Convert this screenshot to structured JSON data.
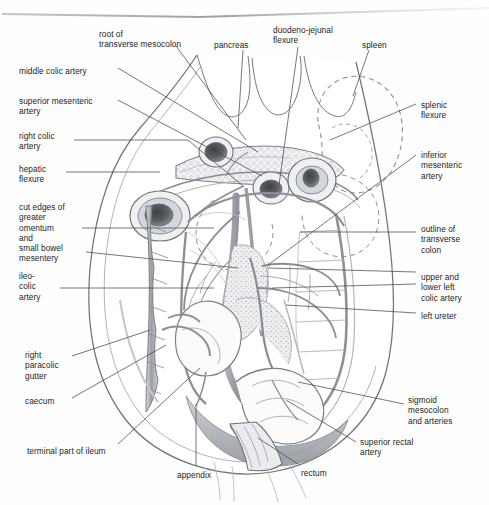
{
  "figure": {
    "medium": "pencil-and-wash anatomical drawing (scanned textbook page)",
    "colors": {
      "paper": "#fefefe",
      "ink": "#1c1c1c",
      "leader": "#4a4a4a",
      "outline": "#6f7378",
      "vessel": "#8d9097",
      "wash_light": "#e7e9ec",
      "wash_mid": "#c9ccd1",
      "wash_dark": "#9aa0a7",
      "cut_lumen": "#55585d",
      "dashed": "#8b9096"
    }
  },
  "labels": {
    "top": [
      {
        "id": "root-of-transverse-mesocolon",
        "lines": [
          "root of",
          "transverse mesocolon"
        ],
        "x": 99,
        "y": 29
      },
      {
        "id": "pancreas",
        "lines": [
          "pancreas"
        ],
        "x": 214,
        "y": 40
      },
      {
        "id": "duodeno-jejunal-flexure",
        "lines": [
          "duodeno-jejunal",
          "flexure"
        ],
        "x": 273,
        "y": 25
      },
      {
        "id": "spleen",
        "lines": [
          "spleen"
        ],
        "x": 362,
        "y": 40
      }
    ],
    "left": [
      {
        "id": "middle-colic-artery",
        "lines": [
          "middle colic artery"
        ],
        "x": 19,
        "y": 66
      },
      {
        "id": "superior-mesenteric-artery",
        "lines": [
          "superior mesenteric",
          "artery"
        ],
        "x": 19,
        "y": 96
      },
      {
        "id": "right-colic-artery",
        "lines": [
          "right colic",
          "artery"
        ],
        "x": 19,
        "y": 131
      },
      {
        "id": "hepatic-flexure",
        "lines": [
          "hepatic",
          "flexure"
        ],
        "x": 19,
        "y": 164
      },
      {
        "id": "cut-edges-of-greater-omentum-and-small-bowel-mesentery",
        "lines": [
          "cut edges of",
          "greater",
          "omentum",
          "and",
          "small bowel",
          "mesentery"
        ],
        "x": 19,
        "y": 202
      },
      {
        "id": "ileo-colic-artery",
        "lines": [
          "ileo-",
          "colic",
          "artery"
        ],
        "x": 19,
        "y": 271
      },
      {
        "id": "right-paracolic-gutter",
        "lines": [
          "right",
          "paracolic",
          "gutter"
        ],
        "x": 25,
        "y": 350
      },
      {
        "id": "caecum",
        "lines": [
          "caecum"
        ],
        "x": 25,
        "y": 396
      },
      {
        "id": "terminal-part-of-ileum",
        "lines": [
          "terminal part of ileum"
        ],
        "x": 27,
        "y": 446
      }
    ],
    "right": [
      {
        "id": "splenic-flexure",
        "lines": [
          "splenic",
          "flexure"
        ],
        "x": 421,
        "y": 100
      },
      {
        "id": "inferior-mesenteric-artery",
        "lines": [
          "inferior",
          "mesenteric",
          "artery"
        ],
        "x": 421,
        "y": 150
      },
      {
        "id": "outline-of-transverse-colon",
        "lines": [
          "outline of",
          "transverse",
          "colon"
        ],
        "x": 421,
        "y": 224
      },
      {
        "id": "upper-and-lower-left-colic-artery",
        "lines": [
          "upper and",
          "lower left",
          "colic artery"
        ],
        "x": 421,
        "y": 272
      },
      {
        "id": "left-ureter",
        "lines": [
          "left ureter"
        ],
        "x": 421,
        "y": 311
      },
      {
        "id": "sigmoid-mesocolon-and-arteries",
        "lines": [
          "sigmoid",
          "mesocolon",
          "and arteries"
        ],
        "x": 408,
        "y": 395
      },
      {
        "id": "superior-rectal-artery",
        "lines": [
          "superior rectal",
          "artery"
        ],
        "x": 360,
        "y": 437
      }
    ],
    "bottom": [
      {
        "id": "appendix",
        "lines": [
          "appendix"
        ],
        "x": 177,
        "y": 470
      },
      {
        "id": "rectum",
        "lines": [
          "rectum"
        ],
        "x": 301,
        "y": 468
      }
    ]
  },
  "leaders": [
    {
      "id": "leader-root-of-transverse-mesocolon",
      "d": "M176,46 L246,140"
    },
    {
      "id": "leader-pancreas",
      "d": "M243,50 L238,128"
    },
    {
      "id": "leader-duodeno-jejunal-flexure",
      "d": "M298,47 L279,185"
    },
    {
      "id": "leader-spleen",
      "d": "M369,50 L353,96"
    },
    {
      "id": "leader-middle-colic-artery",
      "d": "M118,68 L258,152"
    },
    {
      "id": "leader-superior-mesenteric-artery",
      "d": "M118,100 L262,176"
    },
    {
      "id": "leader-right-colic-artery",
      "d": "M74,140 L188,140 L243,186"
    },
    {
      "id": "leader-hepatic-flexure",
      "d": "M66,172 L160,172"
    },
    {
      "id": "leader-cut-edges-omentum",
      "d": "M82,228 L214,228"
    },
    {
      "id": "leader-cut-edges-mesentery",
      "d": "M86,252 L238,268"
    },
    {
      "id": "leader-ileo-colic-artery",
      "d": "M60,288 L214,288"
    },
    {
      "id": "leader-right-paracolic-gutter",
      "d": "M72,356 L150,330"
    },
    {
      "id": "leader-caecum",
      "d": "M72,398 L166,345"
    },
    {
      "id": "leader-terminal-part-of-ileum",
      "d": "M118,444 L200,368"
    },
    {
      "id": "leader-splenic-flexure",
      "d": "M416,104 L330,140"
    },
    {
      "id": "leader-inferior-mesenteric-artery",
      "d": "M416,155 L268,265"
    },
    {
      "id": "leader-outline-of-transverse-colon",
      "d": "M416,232 L300,232"
    },
    {
      "id": "leader-upper-left-colic-artery",
      "d": "M416,272 L268,268"
    },
    {
      "id": "leader-lower-left-colic-artery",
      "d": "M416,284 L272,288"
    },
    {
      "id": "leader-left-ureter",
      "d": "M416,313 L286,305"
    },
    {
      "id": "leader-sigmoid-mesocolon",
      "d": "M404,404 L298,382"
    },
    {
      "id": "leader-superior-rectal-artery",
      "d": "M356,442 L286,400"
    },
    {
      "id": "leader-appendix",
      "d": "M196,466 L196,404"
    },
    {
      "id": "leader-rectum",
      "d": "M298,464 L258,438"
    }
  ]
}
